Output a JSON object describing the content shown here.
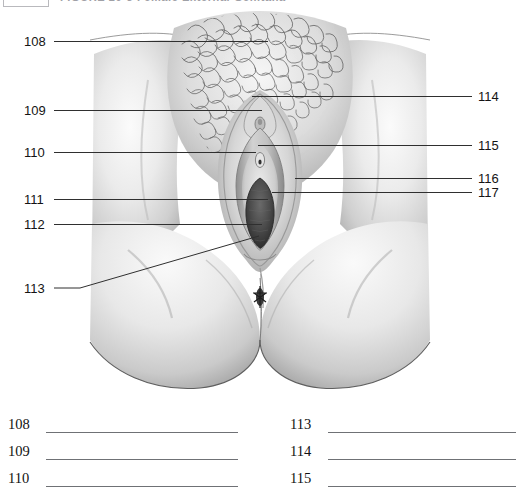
{
  "header": {
    "figure_box_label": "",
    "title": "FIGURE 20-3    Female External Genitalia"
  },
  "figure": {
    "alt_name": "female-external-genitalia-illustration",
    "callouts_left": [
      {
        "number": "108",
        "x": 24,
        "y": 36,
        "line": {
          "x1": 54,
          "y1": 41,
          "x2": 268,
          "y2": 41
        }
      },
      {
        "number": "109",
        "x": 24,
        "y": 105,
        "line": {
          "x1": 54,
          "y1": 110,
          "x2": 262,
          "y2": 110
        }
      },
      {
        "number": "110",
        "x": 24,
        "y": 147,
        "line": {
          "x1": 54,
          "y1": 152,
          "x2": 256,
          "y2": 152
        }
      },
      {
        "number": "111",
        "x": 24,
        "y": 194,
        "line": {
          "x1": 54,
          "y1": 199,
          "x2": 268,
          "y2": 199
        }
      },
      {
        "number": "112",
        "x": 24,
        "y": 219,
        "line": {
          "x1": 54,
          "y1": 224,
          "x2": 262,
          "y2": 224
        }
      },
      {
        "number": "113",
        "x": 24,
        "y": 283,
        "line": {
          "x1": 54,
          "y1": 288,
          "x2": 80,
          "y2": 288
        }
      }
    ],
    "callout_113_diagonal": {
      "x1": 80,
      "y1": 288,
      "x2": 259,
      "y2": 236
    },
    "callouts_right": [
      {
        "number": "114",
        "x": 478,
        "y": 91,
        "line": {
          "x1": 252,
          "y1": 96,
          "x2": 472,
          "y2": 96
        }
      },
      {
        "number": "115",
        "x": 478,
        "y": 140,
        "line": {
          "x1": 258,
          "y1": 145,
          "x2": 472,
          "y2": 145
        }
      },
      {
        "number": "116",
        "x": 478,
        "y": 173,
        "line": {
          "x1": 295,
          "y1": 178,
          "x2": 472,
          "y2": 178
        }
      },
      {
        "number": "117",
        "x": 478,
        "y": 187,
        "line": {
          "x1": 272,
          "y1": 192,
          "x2": 472,
          "y2": 192
        }
      }
    ]
  },
  "answers": {
    "left_column": [
      {
        "number": "108",
        "value": ""
      },
      {
        "number": "109",
        "value": ""
      },
      {
        "number": "110",
        "value": ""
      }
    ],
    "right_column": [
      {
        "number": "113",
        "value": ""
      },
      {
        "number": "114",
        "value": ""
      },
      {
        "number": "115",
        "value": ""
      }
    ]
  },
  "colors": {
    "ink": "#141414",
    "line": "#3a3a3a",
    "blank_line": "#6f7175",
    "skin_light": "#f2f2f2",
    "skin_mid": "#cfcfcf",
    "skin_shadow": "#9a9a9a",
    "hair": "#6b6b6b",
    "introitus": "#4a4a4a"
  }
}
